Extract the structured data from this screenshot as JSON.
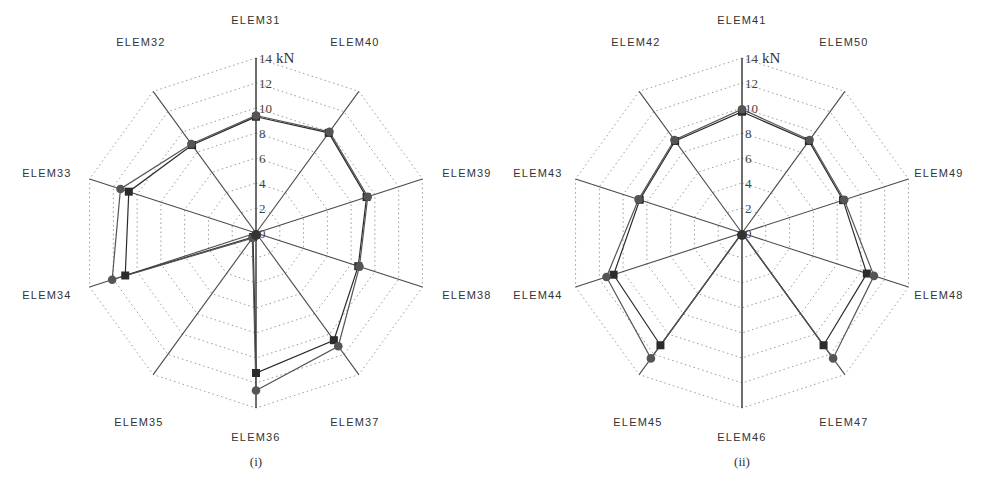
{
  "figure": {
    "unit": "kN",
    "colors": {
      "axis": "#4a4a4a",
      "grid": "#9a9a9a",
      "series_square": "#2b2b2b",
      "series_circle": "#555555"
    }
  },
  "chart_data": [
    {
      "type": "radar",
      "caption": "(i)",
      "title": "",
      "radial_unit": "kN",
      "rlim": [
        0,
        14
      ],
      "radial_ticks": [
        0,
        2,
        4,
        6,
        8,
        10,
        12,
        14
      ],
      "grid": "dotted decagon rings every 2 kN",
      "categories": [
        "ELEM31",
        "ELEM40",
        "ELEM39",
        "ELEM38",
        "ELEM37",
        "ELEM36",
        "ELEM35",
        "ELEM34",
        "ELEM33",
        "ELEM32"
      ],
      "series": [
        {
          "name": "square markers",
          "marker": "square",
          "values": [
            9.3,
            9.9,
            9.3,
            8.6,
            10.6,
            11.2,
            0.4,
            11.0,
            10.7,
            8.7
          ]
        },
        {
          "name": "circle markers",
          "marker": "circle",
          "values": [
            9.4,
            10.0,
            9.4,
            8.7,
            11.2,
            12.6,
            0.5,
            12.1,
            11.4,
            8.8
          ]
        }
      ]
    },
    {
      "type": "radar",
      "caption": "(ii)",
      "title": "",
      "radial_unit": "kN",
      "rlim": [
        0,
        14
      ],
      "radial_ticks": [
        0,
        2,
        4,
        6,
        8,
        10,
        12,
        14
      ],
      "grid": "dotted decagon rings every 2 kN",
      "categories": [
        "ELEM41",
        "ELEM50",
        "ELEM49",
        "ELEM48",
        "ELEM47",
        "ELEM46",
        "ELEM45",
        "ELEM44",
        "ELEM43",
        "ELEM42"
      ],
      "series": [
        {
          "name": "square markers",
          "marker": "square",
          "values": [
            9.7,
            9.1,
            8.5,
            10.5,
            11.1,
            0.0,
            11.1,
            10.8,
            8.6,
            9.1
          ]
        },
        {
          "name": "circle markers",
          "marker": "circle",
          "values": [
            9.9,
            9.2,
            8.6,
            11.1,
            12.4,
            0.0,
            12.4,
            11.4,
            8.7,
            9.2
          ]
        }
      ]
    }
  ]
}
